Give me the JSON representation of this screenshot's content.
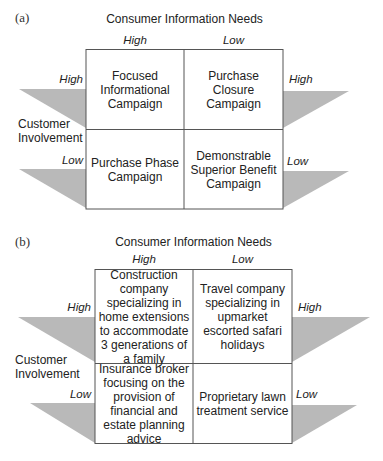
{
  "panels": [
    {
      "label": "(a)",
      "top_axis_title": "Consumer Information Needs",
      "top_ticks": [
        "High",
        "Low"
      ],
      "side_axis_title_line1": "Customer",
      "side_axis_title_line2": "Involvement",
      "left_ticks": [
        "High",
        "Low"
      ],
      "right_ticks": [
        "High",
        "Low"
      ],
      "cells": {
        "high_high": "Focused Informational Campaign",
        "high_low": "Purchase Closure Campaign",
        "low_high": "Purchase Phase Campaign",
        "low_low": "Demonstrable Superior Benefit Campaign"
      }
    },
    {
      "label": "(b)",
      "top_axis_title": "Consumer Information Needs",
      "top_ticks": [
        "High",
        "Low"
      ],
      "side_axis_title_line1": "Customer",
      "side_axis_title_line2": "Involvement",
      "left_ticks": [
        "High",
        "Low"
      ],
      "right_ticks": [
        "High",
        "Low"
      ],
      "cells": {
        "high_high": "Construction company specializing in home extensions to accommodate 3 generations of a family",
        "high_low": "Travel company specializing in upmarket escorted safari holidays",
        "low_high": "Insurance broker focusing on the provision of financial and estate planning advice",
        "low_low": "Proprietary lawn treatment service"
      }
    }
  ],
  "colors": {
    "triangle_fill": "#b9b9b9",
    "grid_line": "#555555"
  }
}
